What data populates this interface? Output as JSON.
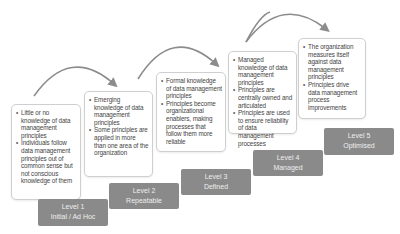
{
  "diagram": {
    "type": "maturity-model",
    "colors": {
      "label_bg": "#8a8a8a",
      "label_text": "#eeeeee",
      "box_border": "#cfcfcf",
      "arrow": "#8c8c8c",
      "text": "#444444"
    },
    "levels": [
      {
        "level": "Level 1",
        "name": "Initial / Ad Hoc",
        "bullets": [
          "Little or no knowledge of data management principles",
          "Individuals follow data management principles out of common sense but not conscious knowledge of them"
        ]
      },
      {
        "level": "Level 2",
        "name": "Repeatable",
        "bullets": [
          "Emerging knowledge of data management principles",
          "Some principles are applied in more than one area of the organization"
        ]
      },
      {
        "level": "Level 3",
        "name": "Defined",
        "bullets": [
          "Formal knowledge of data management principles",
          "Principles become organizational enablers, making processes that follow them more reliable"
        ]
      },
      {
        "level": "Level 4",
        "name": "Managed",
        "bullets": [
          "Managed knowledge of data management principles",
          "Principles are centrally owned and articulated",
          "Principles are used to ensure reliability of data management processes"
        ]
      },
      {
        "level": "Level 5",
        "name": "Optimised",
        "bullets": [
          "The organization measures itself against data management principles",
          "Principles drive data management process improvements"
        ]
      }
    ]
  }
}
